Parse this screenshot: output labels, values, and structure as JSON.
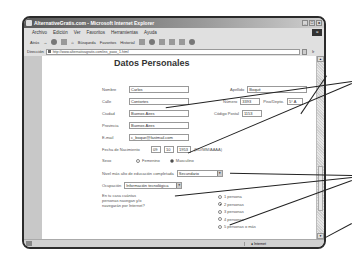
{
  "window": {
    "title": "AlternativeGratis.com - Microsoft Internet Explorer",
    "controls": [
      "_",
      "□",
      "x"
    ]
  },
  "menubar": {
    "items": [
      "Archivo",
      "Edición",
      "Ver",
      "Favoritos",
      "Herramientas",
      "Ayuda"
    ]
  },
  "toolbar": {
    "back": "Atrás",
    "search": "Búsqueda",
    "favorites": "Favoritos",
    "history": "Historial"
  },
  "addressbar": {
    "label": "Dirección",
    "url": "http://www.alternativagratis.com/ins_paso_1.html",
    "go": "Ir"
  },
  "form": {
    "title": "Datos Personales",
    "nombre": {
      "label": "Nombre",
      "value": "Carlos"
    },
    "apellido": {
      "label": "Apellido",
      "value": "Boqué"
    },
    "calle": {
      "label": "Calle",
      "value": "Contortes"
    },
    "numero": {
      "label": "Número",
      "value": "3393"
    },
    "piso": {
      "label": "Piso/Depto.",
      "value": "5° A"
    },
    "ciudad": {
      "label": "Ciudad",
      "value": "Buenos Aires"
    },
    "codigo_postal": {
      "label": "Código Postal",
      "value": "1153"
    },
    "provincia": {
      "label": "Provincia",
      "value": "Buenos Aires"
    },
    "email": {
      "label": "E-mail",
      "value": "c_boque@fastmail.com"
    },
    "fecha": {
      "label": "Fecha de Nacimiento",
      "dd": "09",
      "mm": "10",
      "aaaa": "1953",
      "format": "(DD/MM/AAAA)"
    },
    "sexo": {
      "label": "Sexo",
      "options": [
        "Femenino",
        "Masculino"
      ],
      "selected": "Masculino"
    },
    "educacion": {
      "label": "Nivel más alto de educación completada",
      "value": "Secundario"
    },
    "ocupacion": {
      "label": "Ocupación",
      "value": "Información tecnológica"
    },
    "navegan": {
      "question": [
        "En tu casa cuántas",
        "personas navegan y/o",
        "navegarán por Internet?"
      ],
      "options": [
        "1 persona",
        "2 personas",
        "3 personas",
        "4 personas",
        "5 personas o más"
      ],
      "selected": "2 personas"
    }
  },
  "statusbar": {
    "zone": "Internet"
  }
}
